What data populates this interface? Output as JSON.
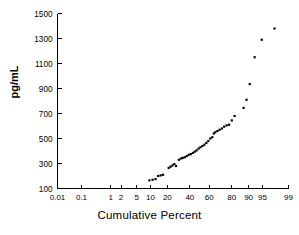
{
  "chart_data": {
    "type": "scatter",
    "title": "",
    "xlabel": "Cumulative Percent",
    "ylabel": "pg/mL",
    "xscale": "probit",
    "yscale": "linear",
    "grid": false,
    "legend": null,
    "ylim": [
      100,
      1500
    ],
    "ytick_labels": [
      "1500",
      "1300",
      "1100",
      "900",
      "700",
      "500",
      "300",
      "100"
    ],
    "ytick_values": [
      1500,
      1300,
      1100,
      900,
      700,
      500,
      300,
      100
    ],
    "xlim": [
      0.01,
      99
    ],
    "xtick_labels": [
      "0.01",
      "0.1",
      "1",
      "2",
      "5",
      "10",
      "20",
      "40",
      "60",
      "80",
      "90",
      "95",
      "99"
    ],
    "xtick_values": [
      0.01,
      0.1,
      1,
      2,
      5,
      10,
      20,
      40,
      60,
      80,
      90,
      95,
      99
    ],
    "marker": "square",
    "marker_color": "#000000",
    "marker_size_px": 2.2,
    "points": [
      {
        "x": 9.5,
        "y": 165
      },
      {
        "x": 11.0,
        "y": 170
      },
      {
        "x": 12.5,
        "y": 175
      },
      {
        "x": 14.0,
        "y": 200
      },
      {
        "x": 15.5,
        "y": 205
      },
      {
        "x": 17.0,
        "y": 210
      },
      {
        "x": 21.0,
        "y": 265
      },
      {
        "x": 22.5,
        "y": 275
      },
      {
        "x": 24.0,
        "y": 285
      },
      {
        "x": 25.5,
        "y": 295
      },
      {
        "x": 27.0,
        "y": 280
      },
      {
        "x": 29.5,
        "y": 330
      },
      {
        "x": 31.5,
        "y": 340
      },
      {
        "x": 33.0,
        "y": 345
      },
      {
        "x": 35.0,
        "y": 350
      },
      {
        "x": 37.0,
        "y": 360
      },
      {
        "x": 39.0,
        "y": 370
      },
      {
        "x": 41.0,
        "y": 375
      },
      {
        "x": 43.0,
        "y": 385
      },
      {
        "x": 45.0,
        "y": 395
      },
      {
        "x": 47.0,
        "y": 405
      },
      {
        "x": 49.0,
        "y": 420
      },
      {
        "x": 51.0,
        "y": 430
      },
      {
        "x": 53.0,
        "y": 440
      },
      {
        "x": 55.0,
        "y": 450
      },
      {
        "x": 57.0,
        "y": 465
      },
      {
        "x": 59.0,
        "y": 480
      },
      {
        "x": 61.0,
        "y": 500
      },
      {
        "x": 63.0,
        "y": 510
      },
      {
        "x": 64.5,
        "y": 540
      },
      {
        "x": 66.0,
        "y": 550
      },
      {
        "x": 68.0,
        "y": 560
      },
      {
        "x": 70.0,
        "y": 570
      },
      {
        "x": 72.0,
        "y": 580
      },
      {
        "x": 74.0,
        "y": 595
      },
      {
        "x": 76.0,
        "y": 605
      },
      {
        "x": 78.0,
        "y": 610
      },
      {
        "x": 80.0,
        "y": 645
      },
      {
        "x": 82.0,
        "y": 680
      },
      {
        "x": 87.5,
        "y": 745
      },
      {
        "x": 89.0,
        "y": 810
      },
      {
        "x": 90.5,
        "y": 935
      },
      {
        "x": 92.5,
        "y": 1150
      },
      {
        "x": 94.8,
        "y": 1290
      },
      {
        "x": 97.5,
        "y": 1380
      }
    ]
  },
  "axes": {
    "y_title": "pg/mL",
    "x_title": "Cumulative Percent"
  }
}
